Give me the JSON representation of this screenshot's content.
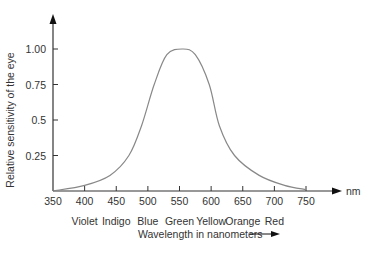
{
  "chart_data": {
    "type": "line",
    "title": "",
    "xlabel": "Wavelength in nanometers",
    "ylabel": "Relative sensitivity of the eye",
    "x_unit": "nm",
    "xlim": [
      350,
      750
    ],
    "ylim": [
      0,
      1.0
    ],
    "grid": false,
    "legend": null,
    "x_ticks": [
      350,
      400,
      450,
      500,
      550,
      600,
      650,
      700,
      750
    ],
    "x_tick_labels": [
      "350",
      "400",
      "450",
      "500",
      "550",
      "600",
      "650",
      "700",
      "750"
    ],
    "y_ticks": [
      0.25,
      0.5,
      0.75,
      1.0
    ],
    "y_tick_labels": [
      "0.25",
      "0.5",
      "0.75",
      "1.00"
    ],
    "color_bands": [
      "Violet",
      "Indigo",
      "Blue",
      "Green",
      "Yellow",
      "Orange",
      "Red"
    ],
    "series": [
      {
        "name": "Relative sensitivity",
        "x": [
          350,
          400,
          440,
          470,
          490,
          510,
          530,
          555,
          575,
          597,
          613,
          637,
          676,
          716,
          750
        ],
        "y": [
          0.0,
          0.04,
          0.11,
          0.25,
          0.46,
          0.75,
          0.96,
          1.0,
          0.96,
          0.75,
          0.46,
          0.25,
          0.11,
          0.04,
          0.01
        ]
      }
    ],
    "line_color": "#888888"
  }
}
